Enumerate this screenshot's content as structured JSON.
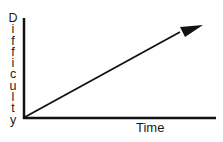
{
  "diagram": {
    "y_axis_label": "Difficulty",
    "y_axis_letters": [
      "D",
      "i",
      "f",
      "f",
      "i",
      "c",
      "u",
      "l",
      "t",
      "y"
    ],
    "x_axis_label": "Time",
    "line_color": "#111111",
    "trend": "linear increase"
  }
}
